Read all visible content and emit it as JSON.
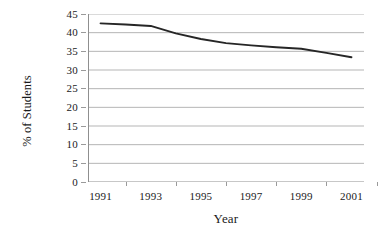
{
  "chart_data": {
    "type": "line",
    "title": "",
    "xlabel": "Year",
    "ylabel": "% of Students",
    "x": [
      1991,
      1992,
      1993,
      1994,
      1995,
      1996,
      1997,
      1998,
      1999,
      2000,
      2001
    ],
    "values": [
      42.5,
      42.2,
      41.8,
      39.8,
      38.3,
      37.2,
      36.6,
      36.1,
      35.7,
      34.6,
      33.4
    ],
    "series": [
      {
        "name": "% of Students",
        "values": [
          42.5,
          42.2,
          41.8,
          39.8,
          38.3,
          37.2,
          36.6,
          36.1,
          35.7,
          34.6,
          33.4
        ]
      }
    ],
    "xtick_labels": [
      "1991",
      "1993",
      "1995",
      "1997",
      "1999",
      "2001"
    ],
    "xtick_values": [
      1991,
      1993,
      1995,
      1997,
      1999,
      2001
    ],
    "ytick_labels": [
      "0",
      "5",
      "10",
      "15",
      "20",
      "25",
      "30",
      "35",
      "40",
      "45"
    ],
    "ytick_values": [
      0,
      5,
      10,
      15,
      20,
      25,
      30,
      35,
      40,
      45
    ],
    "ylim": [
      0,
      45
    ],
    "xlim": [
      1990.5,
      2001.5
    ],
    "grid": "horizontal",
    "legend": "none",
    "line_color": "#262626",
    "grid_color": "#b5b5b5",
    "axis_color": "#8f8f8f",
    "background_color": "#ffffff"
  }
}
